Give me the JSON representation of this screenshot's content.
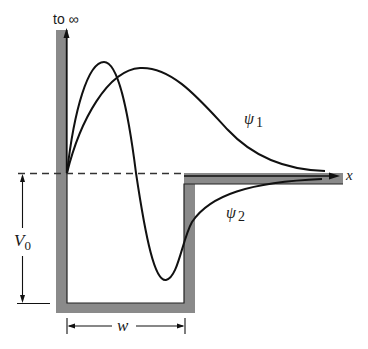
{
  "figure": {
    "type": "finite square potential well with bound-state wavefunctions",
    "colors": {
      "wall": "#8a8a8a",
      "curve": "#111111",
      "dashed_line": "#333333",
      "background": "#ffffff"
    }
  },
  "labels": {
    "top_arrow": "to ∞",
    "x_axis": "x",
    "psi1_symbol": "ψ",
    "psi1_sub": "1",
    "psi2_symbol": "ψ",
    "psi2_sub": "2",
    "depth_symbol": "V",
    "depth_sub": "0",
    "width": "w"
  },
  "curves": [
    {
      "name": "psi1",
      "description": "ground state, single positive hump, decays into step region"
    },
    {
      "name": "psi2",
      "description": "first excited state, one node inside well, decays toward zero from below"
    }
  ]
}
